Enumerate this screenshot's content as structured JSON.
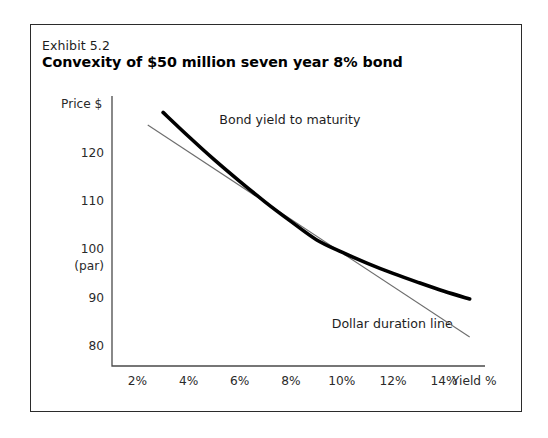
{
  "exhibit": {
    "number": "Exhibit 5.2",
    "title": "Convexity of $50 million seven year 8% bond"
  },
  "colors": {
    "frame": "#2b2b2b",
    "axis": "#4a4a4a",
    "bond_curve": "#000000",
    "duration_line": "#6d6d6d",
    "background": "#ffffff",
    "text": "#1d1d1d"
  },
  "chart_data": {
    "type": "line",
    "title": "Convexity of $50 million seven year 8% bond",
    "subtitle": "Exhibit 5.2",
    "xlabel": "Yield %",
    "ylabel": "Price $",
    "xlim": [
      1.0,
      15.6
    ],
    "ylim": [
      76,
      132
    ],
    "grid": false,
    "legend": "inline-annotations",
    "xticks": [
      {
        "value": 2,
        "label": "2%"
      },
      {
        "value": 4,
        "label": "4%"
      },
      {
        "value": 6,
        "label": "6%"
      },
      {
        "value": 8,
        "label": "8%"
      },
      {
        "value": 10,
        "label": "10%"
      },
      {
        "value": 12,
        "label": "12%"
      },
      {
        "value": 14,
        "label": "14%"
      }
    ],
    "yticks": [
      {
        "value": 120,
        "label": "120",
        "sublabel": ""
      },
      {
        "value": 110,
        "label": "110",
        "sublabel": ""
      },
      {
        "value": 100,
        "label": "100",
        "sublabel": "(par)"
      },
      {
        "value": 90,
        "label": "90",
        "sublabel": ""
      },
      {
        "value": 80,
        "label": "80",
        "sublabel": ""
      }
    ],
    "series": [
      {
        "name": "Bond yield to maturity",
        "style": "thick-convex-curve",
        "annotation": "Bond yield to maturity",
        "x": [
          3.0,
          4.0,
          5.0,
          6.0,
          7.0,
          8.0,
          9.0,
          10.0,
          11.0,
          12.0,
          13.0,
          14.0,
          15.0
        ],
        "y": [
          128.6,
          123.6,
          118.8,
          114.3,
          110.0,
          106.0,
          102.2,
          99.6,
          97.3,
          95.2,
          93.3,
          91.5,
          89.9
        ]
      },
      {
        "name": "Dollar duration line",
        "style": "thin-straight-tangent",
        "annotation": "Dollar duration line",
        "x": [
          2.4,
          15.0
        ],
        "y": [
          126.0,
          82.0
        ]
      }
    ],
    "annotations": [
      {
        "text": "Bond yield to maturity",
        "x": 5.2,
        "y": 127.0
      },
      {
        "text": "Dollar duration line",
        "x": 9.6,
        "y": 84.8
      }
    ]
  }
}
